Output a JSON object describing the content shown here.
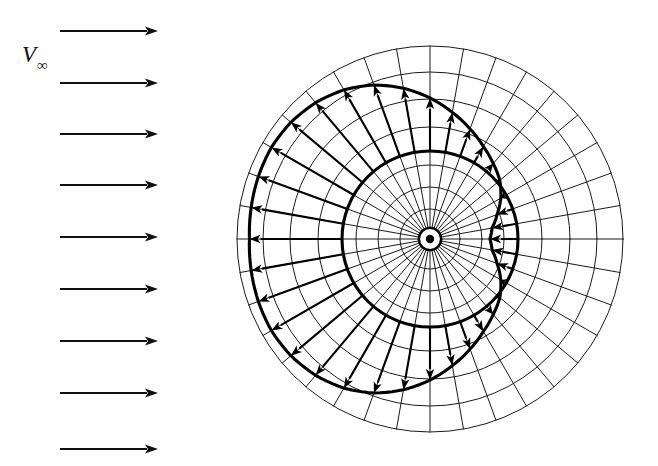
{
  "figure": {
    "background_color": "#ffffff",
    "ink_color": "#111111",
    "width": 658,
    "height": 466
  },
  "freestream": {
    "label_main": "V",
    "label_sub": "∞",
    "label_full": "V∞",
    "label_x": 22,
    "label_y": 62,
    "arrow_count": 9,
    "arrow_x_start": 60,
    "arrow_x_end": 158,
    "arrow_color": "#0f0f0f",
    "arrow_rows_y": [
      31,
      83,
      134,
      185,
      237,
      289,
      341,
      393,
      449
    ]
  },
  "polar_grid": {
    "center_x": 430,
    "center_y": 239,
    "outer_radius": 193,
    "ring_radii": [
      12,
      30,
      52,
      74,
      88,
      112,
      140,
      167,
      193
    ],
    "spoke_count": 36,
    "spoke_step_degrees": 10,
    "spoke_inner_radius": 12,
    "line_color": "#1a1a1a",
    "line_width": 1,
    "center_dot_radius": 4.2,
    "center_ring_radius": 11
  },
  "cylinder": {
    "label": "cylinder-surface",
    "radius": 88,
    "stroke_color": "#000000",
    "stroke_width": 3.1
  },
  "chart_data": {
    "type": "line",
    "xlabel": "",
    "ylabel": "",
    "angle_unit": "degrees",
    "radius_unit": "pixels",
    "vector_base_radius": 88,
    "vector_scale_px_per_unit": 52,
    "series": [
      {
        "name": "surface velocity magnitude (signed radial offset)",
        "angles": [
          0,
          10,
          20,
          30,
          40,
          50,
          60,
          70,
          80,
          90,
          100,
          110,
          120,
          130,
          140,
          150,
          160,
          170,
          180,
          190,
          200,
          210,
          220,
          230,
          240,
          250,
          260,
          270,
          280,
          290,
          300,
          310,
          320,
          330,
          340,
          350
        ],
        "values": [
          1.78,
          1.8,
          1.82,
          1.83,
          1.8,
          1.73,
          1.62,
          1.46,
          1.25,
          1.02,
          0.78,
          0.56,
          0.36,
          0.2,
          0.06,
          -0.12,
          -0.32,
          -0.48,
          -0.54,
          -0.48,
          -0.32,
          -0.12,
          0.06,
          0.2,
          0.36,
          0.56,
          0.78,
          1.02,
          1.25,
          1.46,
          1.62,
          1.73,
          1.8,
          1.83,
          1.82,
          1.8
        ]
      }
    ],
    "legend": [],
    "grid": true,
    "legend_position": "none"
  },
  "vectors": {
    "arrow_color": "#000000",
    "shaft_width": 2.1,
    "head_length": 11,
    "head_half_width": 4.2
  },
  "locus": {
    "label": "velocity-locus-curve",
    "stroke_color": "#000000",
    "stroke_width": 3.1,
    "closed": true
  }
}
